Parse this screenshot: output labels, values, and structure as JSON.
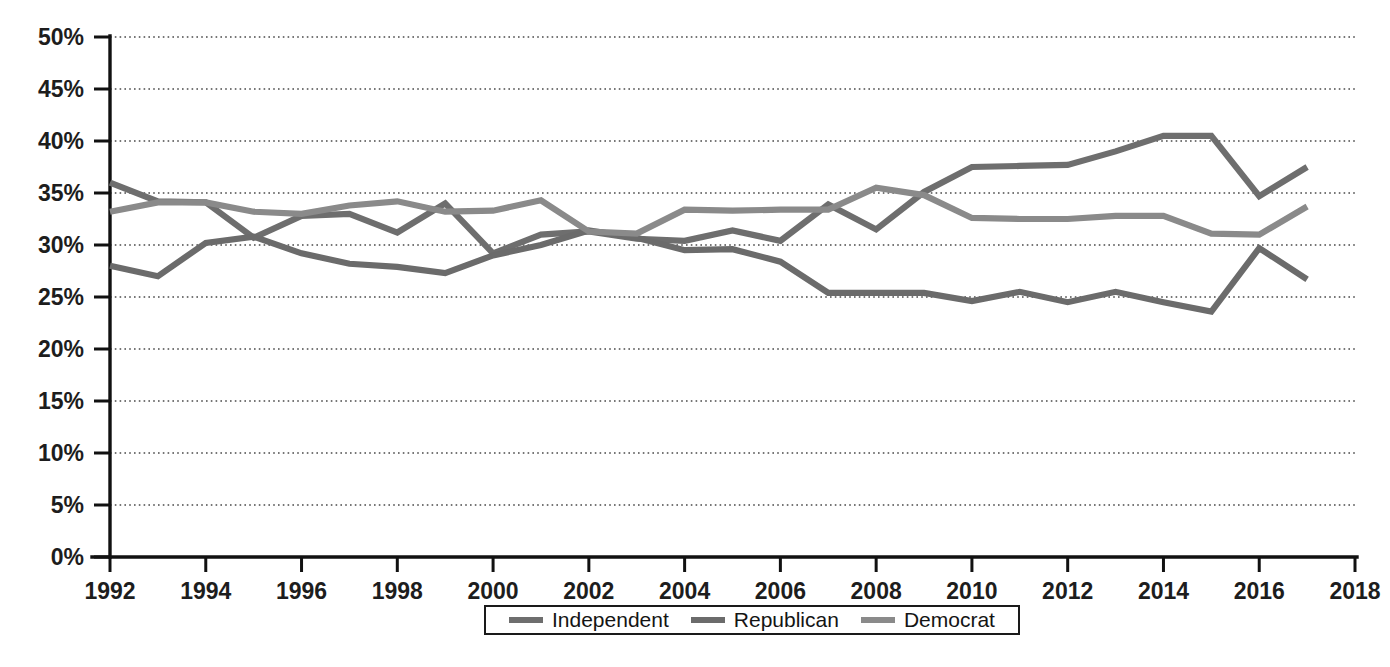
{
  "chart_data": {
    "type": "line",
    "title": "",
    "subtitle": "",
    "xlabel": "",
    "ylabel": "",
    "xlim": [
      1992,
      2018
    ],
    "ylim": [
      0,
      50
    ],
    "grid": true,
    "grid_axis": "y",
    "legend_position": "bottom",
    "x_tick_labels": [
      "1992",
      "1994",
      "1996",
      "1998",
      "2000",
      "2002",
      "2004",
      "2006",
      "2008",
      "2010",
      "2012",
      "2014",
      "2016",
      "2018"
    ],
    "x_tick_values": [
      1992,
      1994,
      1996,
      1998,
      2000,
      2002,
      2004,
      2006,
      2008,
      2010,
      2012,
      2014,
      2016,
      2018
    ],
    "y_tick_labels": [
      "0%",
      "5%",
      "10%",
      "15%",
      "20%",
      "25%",
      "30%",
      "35%",
      "40%",
      "45%",
      "50%"
    ],
    "y_tick_values": [
      0,
      5,
      10,
      15,
      20,
      25,
      30,
      35,
      40,
      45,
      50
    ],
    "x": [
      1992,
      1993,
      1994,
      1995,
      1996,
      1997,
      1998,
      1999,
      2000,
      2001,
      2002,
      2003,
      2004,
      2005,
      2006,
      2007,
      2008,
      2009,
      2010,
      2011,
      2012,
      2013,
      2014,
      2015,
      2016,
      2017
    ],
    "series": [
      {
        "name": "Independent",
        "color": "#6e6e6e",
        "values": [
          36.0,
          34.2,
          34.1,
          30.7,
          32.8,
          33.0,
          31.2,
          34.0,
          29.2,
          31.0,
          31.3,
          30.6,
          30.4,
          31.4,
          30.4,
          33.9,
          31.5,
          35.1,
          37.5,
          37.6,
          37.7,
          39.0,
          40.5,
          40.5,
          34.7,
          37.5
        ]
      },
      {
        "name": "Republican",
        "color": "#6b6b6b",
        "values": [
          28.0,
          27.0,
          30.2,
          30.8,
          29.2,
          28.2,
          27.9,
          27.3,
          29.0,
          30.0,
          31.4,
          30.7,
          29.5,
          29.6,
          28.4,
          25.4,
          25.4,
          25.4,
          24.6,
          25.5,
          24.5,
          25.5,
          24.5,
          23.6,
          29.7,
          26.7
        ]
      },
      {
        "name": "Democrat",
        "color": "#8a8a8a",
        "values": [
          33.2,
          34.1,
          34.1,
          33.2,
          33.0,
          33.8,
          34.2,
          33.2,
          33.3,
          34.3,
          31.3,
          31.1,
          33.4,
          33.3,
          33.4,
          33.4,
          35.5,
          34.8,
          32.6,
          32.5,
          32.5,
          32.8,
          32.8,
          31.1,
          31.0,
          33.7
        ]
      }
    ]
  },
  "legend": {
    "entries": [
      {
        "label": "Independent",
        "color": "#6e6e6e"
      },
      {
        "label": "Republican",
        "color": "#6b6b6b"
      },
      {
        "label": "Democrat",
        "color": "#8a8a8a"
      }
    ]
  }
}
